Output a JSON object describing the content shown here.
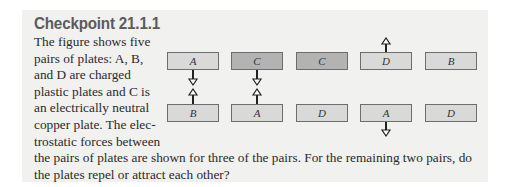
{
  "checkpoint": {
    "title": "Checkpoint 21.1.1",
    "text_lines_wrapped": [
      "The figure shows five",
      "pairs of plates: A, B,",
      "and D are charged",
      "plastic plates and C is",
      "an electrically neutral",
      "copper plate. The elec-",
      "trostatic forces between"
    ],
    "text_full_lines": [
      "the pairs of plates are shown for three of the pairs. For the remaining two pairs, do",
      "the plates repel or attract each other?"
    ]
  },
  "figure": {
    "pairs": [
      {
        "top": "A",
        "bottom": "B",
        "force": "attract",
        "top_copper": false,
        "bottom_copper": false
      },
      {
        "top": "C",
        "bottom": "A",
        "force": "attract",
        "top_copper": true,
        "bottom_copper": false
      },
      {
        "top": "C",
        "bottom": "D",
        "force": "none_shown",
        "top_copper": true,
        "bottom_copper": false
      },
      {
        "top": "D",
        "bottom": "A",
        "force": "repel",
        "top_copper": false,
        "bottom_copper": false
      },
      {
        "top": "B",
        "bottom": "D",
        "force": "none_shown",
        "top_copper": false,
        "bottom_copper": false
      }
    ]
  },
  "colors": {
    "panel_bg": "#f1f1ef",
    "plastic_plate": "#d9d9d9",
    "copper_plate": "#b3b3b3",
    "title": "#5b5b5b"
  }
}
